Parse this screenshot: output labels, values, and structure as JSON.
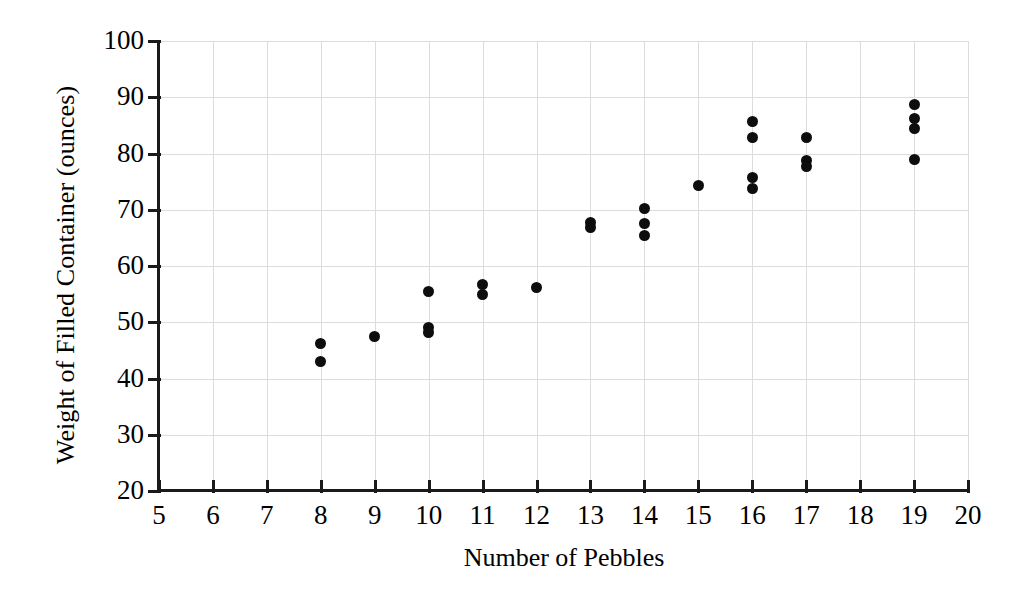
{
  "chart_data": {
    "type": "scatter",
    "title": "",
    "xlabel": "Number of Pebbles",
    "ylabel": "Weight of Filled Container (ounces)",
    "xlim": [
      5,
      20
    ],
    "ylim": [
      20,
      100
    ],
    "xticks": [
      5,
      6,
      7,
      8,
      9,
      10,
      11,
      12,
      13,
      14,
      15,
      16,
      17,
      18,
      19,
      20
    ],
    "yticks": [
      20,
      30,
      40,
      50,
      60,
      70,
      80,
      90,
      100
    ],
    "xticklabels": [
      "5",
      "6",
      "7",
      "8",
      "9",
      "10",
      "11",
      "12",
      "13",
      "14",
      "15",
      "16",
      "17",
      "18",
      "19",
      "20"
    ],
    "yticklabels": [
      "20",
      "30",
      "40",
      "50",
      "60",
      "70",
      "80",
      "90",
      "100"
    ],
    "grid": true,
    "grid_color": "#dcdcdc",
    "legend": false,
    "marker_color": "#0d0d0d",
    "axis_color": "#1a1a1a",
    "x": [
      8,
      8,
      9,
      10,
      10,
      10,
      11,
      11,
      12,
      13,
      13,
      14,
      14,
      14,
      15,
      16,
      16,
      16,
      16,
      17,
      17,
      17,
      19,
      19,
      19,
      19
    ],
    "y": [
      46.2,
      43.1,
      47.5,
      55.4,
      49.0,
      48.2,
      56.8,
      55.0,
      56.2,
      67.8,
      66.8,
      70.3,
      67.5,
      65.5,
      74.3,
      85.7,
      82.8,
      75.8,
      73.8,
      82.9,
      78.8,
      77.7,
      88.8,
      86.3,
      84.5,
      79.0
    ],
    "points": [
      {
        "x": 8,
        "y": 46.2
      },
      {
        "x": 8,
        "y": 43.1
      },
      {
        "x": 9,
        "y": 47.5
      },
      {
        "x": 10,
        "y": 55.4
      },
      {
        "x": 10,
        "y": 49.0
      },
      {
        "x": 10,
        "y": 48.2
      },
      {
        "x": 11,
        "y": 56.8
      },
      {
        "x": 11,
        "y": 55.0
      },
      {
        "x": 12,
        "y": 56.2
      },
      {
        "x": 13,
        "y": 67.8
      },
      {
        "x": 13,
        "y": 66.8
      },
      {
        "x": 14,
        "y": 70.3
      },
      {
        "x": 14,
        "y": 67.5
      },
      {
        "x": 14,
        "y": 65.5
      },
      {
        "x": 15,
        "y": 74.3
      },
      {
        "x": 16,
        "y": 85.7
      },
      {
        "x": 16,
        "y": 82.8
      },
      {
        "x": 16,
        "y": 75.8
      },
      {
        "x": 16,
        "y": 73.8
      },
      {
        "x": 17,
        "y": 82.9
      },
      {
        "x": 17,
        "y": 78.8
      },
      {
        "x": 17,
        "y": 77.7
      },
      {
        "x": 19,
        "y": 88.8
      },
      {
        "x": 19,
        "y": 86.3
      },
      {
        "x": 19,
        "y": 84.5
      },
      {
        "x": 19,
        "y": 79.0
      }
    ]
  }
}
